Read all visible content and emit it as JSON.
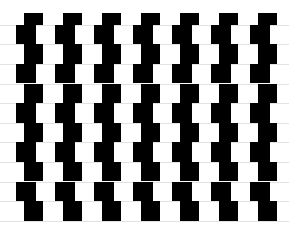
{
  "illusion": {
    "name": "Cafe wall illusion",
    "tile_color": "#000000",
    "background_color": "#ffffff",
    "mortar_color": "#e2e2e2",
    "columns": 7,
    "tile_width": 19.5,
    "column_period": 39,
    "rows": [
      {
        "top": 13.3,
        "height": 11.4,
        "offset": 23.7
      },
      {
        "top": 24.7,
        "height": 19.6,
        "offset": 16
      },
      {
        "top": 44.3,
        "height": 19.6,
        "offset": 23.7
      },
      {
        "top": 63.9,
        "height": 19.6,
        "offset": 16
      },
      {
        "top": 83.5,
        "height": 19.6,
        "offset": 23.7
      },
      {
        "top": 103.1,
        "height": 19.6,
        "offset": 16
      },
      {
        "top": 122.7,
        "height": 19.6,
        "offset": 23.7
      },
      {
        "top": 142.3,
        "height": 19.6,
        "offset": 16
      },
      {
        "top": 161.9,
        "height": 19.6,
        "offset": 23.7
      },
      {
        "top": 181.5,
        "height": 19.6,
        "offset": 16
      },
      {
        "top": 201.1,
        "height": 19.6,
        "offset": 23.7
      }
    ]
  }
}
